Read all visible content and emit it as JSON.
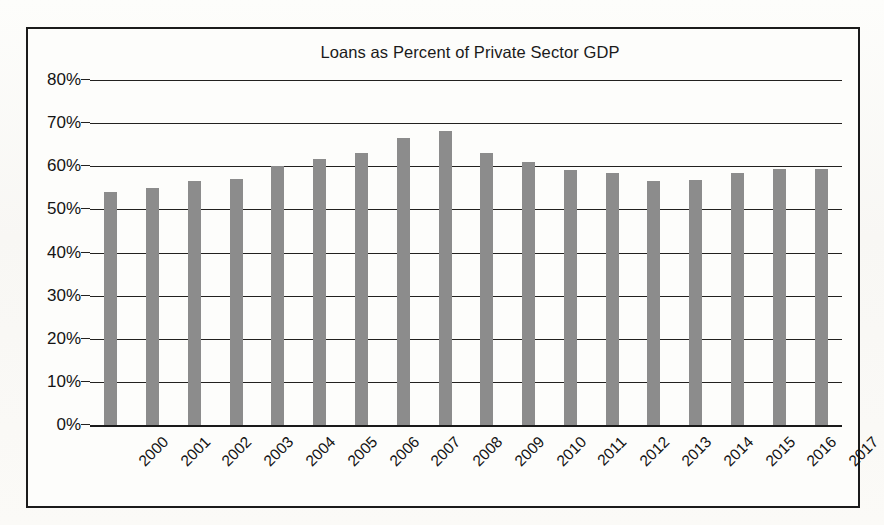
{
  "chart_data": {
    "type": "bar",
    "title": "Loans as Percent of Private Sector GDP",
    "xlabel": "",
    "ylabel": "",
    "ylim": [
      0,
      80
    ],
    "ytick_labels": [
      "80%",
      "70%",
      "60%",
      "50%",
      "40%",
      "30%",
      "20%",
      "10%",
      "0%"
    ],
    "ytick_values": [
      80,
      70,
      60,
      50,
      40,
      30,
      20,
      10,
      0
    ],
    "grid": true,
    "legend": "none",
    "bar_color": "#8c8c8c",
    "categories": [
      "2000",
      "2001",
      "2002",
      "2003",
      "2004",
      "2005",
      "2006",
      "2007",
      "2008",
      "2009",
      "2010",
      "2011",
      "2012",
      "2013",
      "2014",
      "2015",
      "2016",
      "2017"
    ],
    "values": [
      54.0,
      55.0,
      56.5,
      57.0,
      60.1,
      61.8,
      63.1,
      66.6,
      68.1,
      63.0,
      60.9,
      59.2,
      58.4,
      56.6,
      56.9,
      58.5,
      59.4,
      59.3
    ]
  },
  "figure": {
    "frame_color": "#1b1b1b",
    "background_color": "#fdfdfb",
    "axis_color": "#1a1a1a"
  }
}
